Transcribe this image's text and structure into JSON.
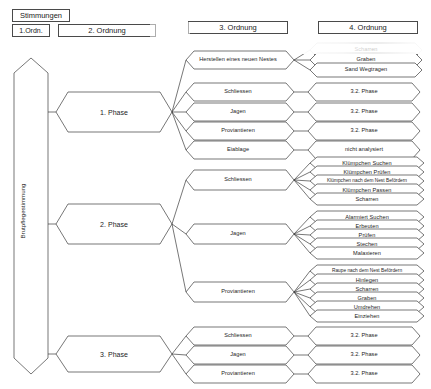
{
  "header": {
    "stimmungen": "Stimmungen",
    "ord1": "1.Ordn.",
    "ord2": "2. Ordnung",
    "ord3": "3. Ordnung",
    "ord4": "4. Ordnung"
  },
  "root": {
    "label": "Brutpflegestimmung"
  },
  "phases": [
    {
      "label": "1. Phase"
    },
    {
      "label": "2. Phase"
    },
    {
      "label": "3. Phase"
    }
  ],
  "ord3": {
    "p1": [
      "Herstellen eines neuen Nestes",
      "Schliessen",
      "Jagen",
      "Proviantieren",
      "Eiablage"
    ],
    "p2": [
      "Schliessen",
      "Jagen",
      "Proviantieren"
    ],
    "p3": [
      "Schliessen",
      "Jagen",
      "Proviantieren"
    ]
  },
  "ord4": {
    "p1_nest": [
      "Scharren",
      "Graben",
      "Sand Wegtragen"
    ],
    "p1_schliessen": "3.2. Phase",
    "p1_jagen": "3.2. Phase",
    "p1_proviantieren": "3.2. Phase",
    "p1_eiablage": "nicht analysiert",
    "p2_schliessen": [
      "Klümpchen Suchen",
      "Klümpchen Prüfen",
      "Klümpchen nach dem Nest Befördern",
      "Klümpchen Passen",
      "Scharren"
    ],
    "p2_jagen": [
      "Alarmiert Suchen",
      "Erbeuten",
      "Prüfen",
      "Stechen",
      "Malaxieren"
    ],
    "p2_proviantieren": [
      "Raupe nach dem Nest Befördern",
      "Hinlegen",
      "Scharren",
      "Graben",
      "Umdrehen",
      "Einziehen"
    ],
    "p3_schliessen": "3.2. Phase",
    "p3_jagen": "3.2. Phase",
    "p3_proviantieren": "3.2. Phase"
  }
}
